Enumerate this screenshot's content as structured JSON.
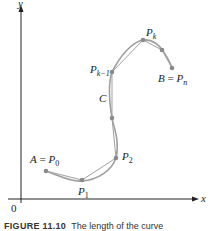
{
  "figure": {
    "axes": {
      "x_label": "x",
      "y_label": "y",
      "origin_label": "0"
    },
    "curve_label": "C",
    "points": {
      "start": {
        "name": "A",
        "eq": "=",
        "sym": "P",
        "sub": "0"
      },
      "p1": {
        "sym": "P",
        "sub": "1"
      },
      "p2": {
        "sym": "P",
        "sub": "2"
      },
      "pk_minus_1": {
        "sym": "P",
        "sub": "k−1"
      },
      "pk": {
        "sym": "P",
        "sub": "k"
      },
      "end": {
        "name": "B",
        "eq": "=",
        "sym": "P",
        "sub": "n"
      }
    },
    "colors": {
      "axis": "#222222",
      "curve": "#9a9a9a",
      "polygon": "#9a9a9a",
      "point": "#8a8a8a"
    },
    "caption": {
      "label": "FIGURE 11.10",
      "text": "The length of the curve"
    }
  }
}
